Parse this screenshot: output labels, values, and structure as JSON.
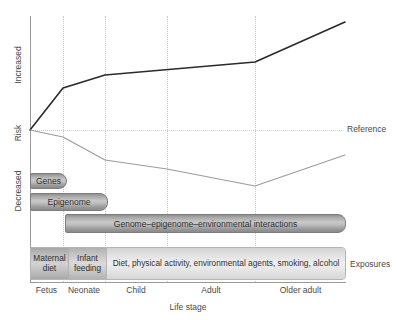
{
  "figure": {
    "reference_label": "Reference",
    "exposures_label": "Exposures",
    "y_axis": {
      "label_top": "Increased",
      "label_middle": "Risk",
      "label_bottom": "Decreased"
    },
    "x_axis": {
      "title": "Life stage",
      "ticks": [
        "Fetus",
        "Neonate",
        "Child",
        "Adult",
        "Older adult"
      ]
    },
    "bars": {
      "genes": "Genes",
      "epigenome": "Epigenome",
      "interactions": "Genome–epigenome–environmental interactions",
      "exposure_maternal": "Maternal diet",
      "exposure_infant": "Infant feeding",
      "exposure_adult": "Diet, physical activity, environmental agents, smoking, alcohol"
    }
  },
  "chart_data": {
    "type": "line",
    "title": "",
    "xlabel": "Life stage",
    "ylabel": "Risk",
    "grid": true,
    "legend": false,
    "x": [
      "Fetus",
      "Neonate",
      "Child",
      "Adult",
      "Older adult"
    ],
    "x_tick_labels": [
      "Fetus",
      "Neonate",
      "Child",
      "Adult",
      "Older adult"
    ],
    "y_tick_labels": [
      "Increased",
      "Risk",
      "Decreased"
    ],
    "y_reference_label": "Reference",
    "annotations": [
      "Reference",
      "Exposures",
      "Genes",
      "Epigenome",
      "Genome–epigenome–environmental interactions",
      "Maternal diet",
      "Infant feeding",
      "Diet, physical activity, environmental agents, smoking, alcohol"
    ],
    "series": [
      {
        "name": "Increased risk trajectory",
        "color": "#2b2b2b",
        "width": 1.6,
        "points": [
          {
            "x": 30,
            "y": 130
          },
          {
            "x": 63,
            "y": 88
          },
          {
            "x": 105,
            "y": 75
          },
          {
            "x": 255,
            "y": 62
          },
          {
            "x": 345,
            "y": 22
          }
        ]
      },
      {
        "name": "Decreased risk trajectory",
        "color": "#9b9b9b",
        "width": 1.1,
        "points": [
          {
            "x": 30,
            "y": 130
          },
          {
            "x": 63,
            "y": 137
          },
          {
            "x": 105,
            "y": 160
          },
          {
            "x": 167,
            "y": 169
          },
          {
            "x": 255,
            "y": 186
          },
          {
            "x": 345,
            "y": 155
          }
        ]
      }
    ],
    "reference_line": {
      "y": 130,
      "style": "dotted",
      "color": "#c9c9d4"
    },
    "gridlines_x": [
      63,
      105,
      167,
      255
    ],
    "bars": [
      {
        "label": "Genes",
        "x_start": 30,
        "x_end": 67,
        "y": 173
      },
      {
        "label": "Epigenome",
        "x_start": 30,
        "x_end": 108,
        "y": 193
      },
      {
        "label": "Genome–epigenome–environmental interactions",
        "x_start": 65,
        "x_end": 346,
        "y": 214
      },
      {
        "label": "Maternal diet",
        "x_start": 30,
        "x_end": 68,
        "y": 247
      },
      {
        "label": "Infant feeding",
        "x_start": 68,
        "x_end": 106,
        "y": 247
      },
      {
        "label": "Diet, physical activity, environmental agents, smoking, alcohol",
        "x_start": 106,
        "x_end": 346,
        "y": 247
      }
    ]
  }
}
